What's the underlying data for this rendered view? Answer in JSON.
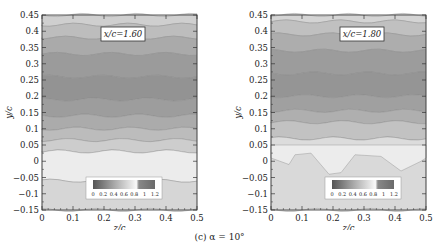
{
  "chart_data": [
    {
      "type": "heatmap",
      "title": "x/c=1.60",
      "xlabel": "z/c",
      "ylabel": "y/c",
      "xlim": [
        0,
        0.5
      ],
      "ylim": [
        -0.15,
        0.45
      ],
      "xticks": [
        "0",
        "0.1",
        "0.2",
        "0.3",
        "0.4",
        "0.5"
      ],
      "yticks": [
        "-0.15",
        "-0.1",
        "-0.05",
        "0",
        "0.05",
        "0.1",
        "0.15",
        "0.2",
        "0.25",
        "0.3",
        "0.35",
        "0.4",
        "0.45"
      ],
      "colorbar": {
        "ticks": [
          "0",
          "0.2",
          "0.4",
          "0.6",
          "0.8",
          "1",
          "1.2"
        ],
        "position": "lower-center"
      },
      "description": "Contour map; dark core between y/c 0.1 and 0.35 centred near z/c 0.25, y/c 0.22; light band near y/c 0 to -0.05"
    },
    {
      "type": "heatmap",
      "title": "x/c=1.80",
      "xlabel": "z/c",
      "ylabel": "y/c",
      "xlim": [
        0,
        0.5
      ],
      "ylim": [
        -0.15,
        0.45
      ],
      "xticks": [
        "0",
        "0.1",
        "0.2",
        "0.3",
        "0.4",
        "0.5"
      ],
      "yticks": [
        "-0.15",
        "-0.1",
        "-0.05",
        "0",
        "0.05",
        "0.1",
        "0.15",
        "0.2",
        "0.25",
        "0.3",
        "0.35",
        "0.4",
        "0.45"
      ],
      "colorbar": {
        "ticks": [
          "0",
          "0.2",
          "0.4",
          "0.6",
          "0.8",
          "1",
          "1.2"
        ],
        "position": "lower-center"
      },
      "description": "Contour map; dark core between y/c 0.12 and 0.35; light band near y/c 0.05 with irregular lobes near y/c 0"
    }
  ],
  "figure": {
    "caption": "(c) α = 10°",
    "panels": [
      {
        "label": "x/c=1.60",
        "xlabel": "z/c",
        "ylabel": "y/c"
      },
      {
        "label": "x/c=1.80",
        "xlabel": "z/c",
        "ylabel": "y/c"
      }
    ],
    "xticks": [
      "0",
      "0.1",
      "0.2",
      "0.3",
      "0.4",
      "0.5"
    ],
    "yticks": [
      "0.45",
      "0.4",
      "0.35",
      "0.3",
      "0.25",
      "0.2",
      "0.15",
      "0.1",
      "0.05",
      "0",
      "−0.05",
      "−0.1",
      "−0.15"
    ],
    "colorbar_ticks": [
      "0",
      "0.2",
      "0.4",
      "0.6",
      "0.8",
      "1",
      "1.2"
    ]
  }
}
